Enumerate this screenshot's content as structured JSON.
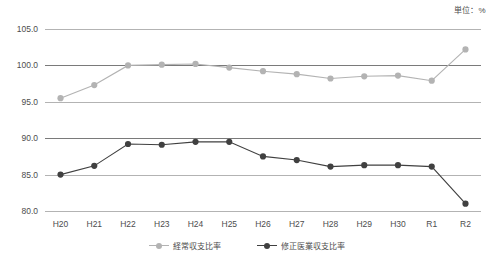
{
  "unit_label": "単位：%",
  "legend": {
    "items": [
      {
        "label": "経常収支比率",
        "color": "#b3b3b3"
      },
      {
        "label": "修正医業収支比率",
        "color": "#404040"
      }
    ]
  },
  "chart_data": {
    "type": "line",
    "title": "",
    "subtitle": "",
    "xlabel": "",
    "ylabel": "",
    "unit": "単位：%",
    "grid": true,
    "legend_position": "bottom-center",
    "ylim": [
      80.0,
      105.0
    ],
    "yticks": [
      "105.0",
      "100.0",
      "95.0",
      "90.0",
      "85.0",
      "80.0"
    ],
    "ytick_values": [
      105.0,
      100.0,
      95.0,
      90.0,
      85.0,
      80.0
    ],
    "categories": [
      "H20",
      "H21",
      "H22",
      "H23",
      "H24",
      "H25",
      "H26",
      "H27",
      "H28",
      "H29",
      "H30",
      "R1",
      "R2"
    ],
    "series": [
      {
        "name": "経常収支比率",
        "color": "#b3b3b3",
        "values": [
          95.5,
          97.3,
          100.0,
          100.1,
          100.2,
          99.7,
          99.2,
          98.8,
          98.2,
          98.5,
          98.6,
          97.9,
          102.2
        ]
      },
      {
        "name": "修正医業収支比率",
        "color": "#404040",
        "values": [
          85.0,
          86.2,
          89.2,
          89.1,
          89.5,
          89.5,
          87.5,
          87.0,
          86.1,
          86.3,
          86.3,
          86.1,
          81.0
        ]
      }
    ]
  }
}
